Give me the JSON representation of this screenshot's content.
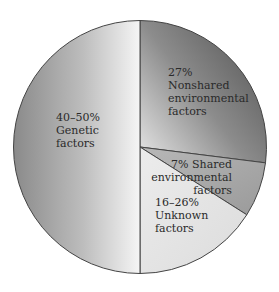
{
  "chart_data": {
    "type": "pie",
    "title": "",
    "slices": [
      {
        "name": "Nonshared environmental factors",
        "label_lines": [
          "27%",
          "Nonshared",
          "environmental",
          "factors"
        ],
        "value": 27,
        "value_text": "27%"
      },
      {
        "name": "Shared environmental factors",
        "label_lines": [
          "7% Shared",
          "environmental",
          "factors"
        ],
        "value": 7,
        "value_text": "7%"
      },
      {
        "name": "Unknown factors",
        "label_lines": [
          "16–26%",
          "Unknown",
          "factors"
        ],
        "value": 16,
        "value_text": "16–26%"
      },
      {
        "name": "Genetic factors",
        "label_lines": [
          "40–50%",
          "Genetic",
          "factors"
        ],
        "value": 50,
        "value_text": "40–50%"
      }
    ],
    "start_angle_deg": -90,
    "direction": "clockwise",
    "legend": "none",
    "colors": {
      "nonshared": [
        "#5a5a5a",
        "#d9d9d9"
      ],
      "shared": "#a9a9a9",
      "unknown": "#e2e2e2",
      "genetic": [
        "#8e8e8e",
        "#f2f2f2"
      ],
      "stroke": "#444444"
    }
  }
}
